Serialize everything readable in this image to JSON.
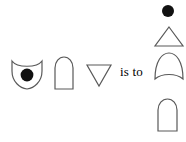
{
  "diagram": {
    "type": "visual-analogy-puzzle",
    "relation_text": "is to",
    "stroke_color": "#595959",
    "fill_color": "#000000",
    "background_color": "#ffffff",
    "left_group": {
      "name": "left-shape-row",
      "items": [
        {
          "id": "shield-with-dot",
          "label": "shield with filled circle",
          "shape": "shield-concave-top",
          "filled": false,
          "contains": "filled-circle"
        },
        {
          "id": "arch-left",
          "label": "arch",
          "shape": "arch-rounded-top",
          "filled": false,
          "contains": null
        },
        {
          "id": "triangle-down",
          "label": "downward triangle",
          "shape": "triangle-pointing-down",
          "filled": false,
          "contains": null
        }
      ]
    },
    "right_group": {
      "name": "right-shape-column",
      "items": [
        {
          "id": "dot-right",
          "label": "filled circle",
          "shape": "circle",
          "filled": true,
          "contains": null
        },
        {
          "id": "triangle-up",
          "label": "upward triangle",
          "shape": "triangle-pointing-up",
          "filled": false,
          "contains": null
        },
        {
          "id": "arch-concave-bottom",
          "label": "arch with concave bottom",
          "shape": "arch-concave-bottom",
          "filled": false,
          "contains": null
        },
        {
          "id": "arch-right",
          "label": "arch",
          "shape": "arch-rounded-top",
          "filled": false,
          "contains": null
        }
      ]
    }
  }
}
